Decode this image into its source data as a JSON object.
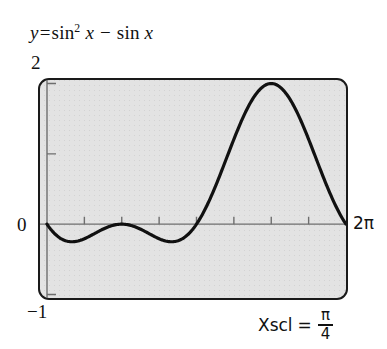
{
  "figure": {
    "name": "graphing-calculator-screen-figure",
    "equation_title": {
      "lhs": "y",
      "equals": "=",
      "fn": "sin",
      "exponent": "2",
      "var1": "x",
      "minus": "−",
      "fn2": "sin",
      "var2": "x",
      "plain": "y = sin² x − sin x"
    },
    "axis_labels": {
      "y_max": "2",
      "y_zero": "0",
      "y_min": "−1",
      "x_max": "2π"
    },
    "xscl_caption": {
      "label": "Xscl",
      "equals": "=",
      "numerator": "π",
      "denominator": "4",
      "plain": "Xscl = π/4"
    },
    "colors": {
      "screen_background": "#e3e3e3",
      "screen_border": "#1a1a1a",
      "curve": "#111111",
      "axis": "#6e6e6e",
      "text": "#111111"
    }
  },
  "chart_data": {
    "type": "line",
    "xlabel": "",
    "ylabel": "",
    "xlim": [
      0,
      6.283185307179586
    ],
    "ylim": [
      -1,
      2
    ],
    "xlim_labels": [
      "0",
      "2π"
    ],
    "ylim_labels": [
      "−1",
      "2"
    ],
    "grid": false,
    "legend": null,
    "x_tick_label": "Xscl = π/4",
    "x_tick_step": 0.7853981633974483,
    "x_tick_step_label": "π/4",
    "y_tick_step": 1,
    "x_ticks": [
      0.7853981633974483,
      1.5707963267948966,
      2.356194490192345,
      3.141592653589793,
      3.9269908169872414,
      4.71238898038469,
      5.497787143782138
    ],
    "y_ticks": [
      -1,
      0,
      1,
      2
    ],
    "annotations": [
      {
        "text": "2",
        "position": "above-top-left-of-screen",
        "value": 2
      },
      {
        "text": "0",
        "position": "left-of-x-axis",
        "value": 0
      },
      {
        "text": "−1",
        "position": "below-bottom-left-of-screen",
        "value": -1
      },
      {
        "text": "2π",
        "position": "right-of-x-axis-end",
        "value": 6.283185307179586
      },
      {
        "text": "Xscl = π/4",
        "position": "below-right-of-screen"
      }
    ],
    "series": [
      {
        "name": "y = sin^2 x - sin x",
        "expression": "sin(x)^2 - sin(x)",
        "color": "#111111",
        "linewidth": 3,
        "key_points": [
          {
            "x": 0,
            "y": 0,
            "label": "start at origin"
          },
          {
            "x": 0.5236,
            "y": -0.25,
            "label": "local minimum, y = -1/4"
          },
          {
            "x": 1.5708,
            "y": 0,
            "label": "x = π/2, zero"
          },
          {
            "x": 2.618,
            "y": -0.25,
            "label": "local minimum, y = -1/4"
          },
          {
            "x": 3.1416,
            "y": 0,
            "label": "x = π, zero"
          },
          {
            "x": 4.7124,
            "y": 2,
            "label": "maximum at x = 3π/2, y = 2"
          },
          {
            "x": 6.2832,
            "y": 0,
            "label": "x = 2π, zero"
          }
        ]
      }
    ]
  }
}
